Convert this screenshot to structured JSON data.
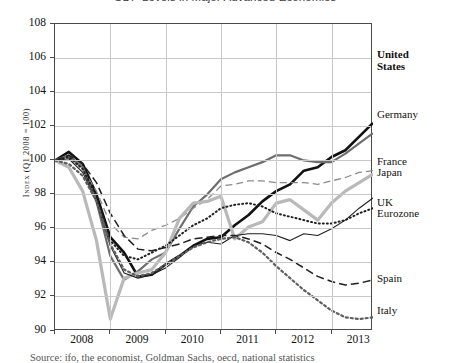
{
  "chart_data": {
    "type": "line",
    "title": "GDP Levels in Major Advanced Economies",
    "caption": "Source: ifo, the economist, Goldman Sachs, oecd, national statistics",
    "xlabel": "",
    "ylabel": "Index (Q1 2008 = 100)",
    "ylim": [
      90,
      108
    ],
    "xlim": [
      2008.0,
      2013.75
    ],
    "ytick_labels": [
      "108",
      "106",
      "104",
      "102",
      "100",
      "98",
      "96",
      "94",
      "92",
      "90"
    ],
    "ytick_values": [
      108,
      106,
      104,
      102,
      100,
      98,
      96,
      94,
      92,
      90
    ],
    "xtick_labels": [
      "2008",
      "2009",
      "2010",
      "2011",
      "2012",
      "2013"
    ],
    "xtick_values": [
      2008,
      2009,
      2010,
      2011,
      2012,
      2013
    ],
    "grid": true,
    "legend_position": "right-inline-end-labels",
    "x": [
      2008.0,
      2008.25,
      2008.5,
      2008.75,
      2009.0,
      2009.25,
      2009.5,
      2009.75,
      2010.0,
      2010.25,
      2010.5,
      2010.75,
      2011.0,
      2011.25,
      2011.5,
      2011.75,
      2012.0,
      2012.25,
      2012.5,
      2012.75,
      2013.0,
      2013.25,
      2013.5,
      2013.75
    ],
    "series": [
      {
        "name": "United States",
        "color": "#111111",
        "width": 2.6,
        "dash": "none",
        "label_bold": true,
        "values": [
          100.0,
          100.5,
          99.8,
          98.0,
          95.5,
          94.6,
          93.2,
          93.3,
          93.9,
          94.4,
          95.0,
          95.4,
          95.5,
          96.2,
          96.8,
          97.6,
          98.2,
          98.6,
          99.4,
          99.6,
          100.2,
          100.6,
          101.4,
          102.2
        ]
      },
      {
        "name": "Germany",
        "color": "#6e6e6e",
        "width": 2.2,
        "dash": "none",
        "label_bold": false,
        "values": [
          100.0,
          100.3,
          99.6,
          97.6,
          94.4,
          93.0,
          93.5,
          94.2,
          94.6,
          96.0,
          97.3,
          98.0,
          98.9,
          99.3,
          99.6,
          99.9,
          100.3,
          100.3,
          100.0,
          99.9,
          99.9,
          100.4,
          101.0,
          101.6
        ]
      },
      {
        "name": "France",
        "color": "#8a8a8a",
        "width": 1.3,
        "dash": "7 4",
        "label_bold": false,
        "values": [
          100.0,
          100.2,
          99.5,
          98.2,
          96.3,
          95.5,
          95.4,
          95.9,
          96.2,
          96.6,
          97.2,
          97.7,
          98.5,
          98.6,
          98.8,
          98.8,
          98.7,
          98.7,
          98.7,
          98.6,
          98.8,
          99.0,
          99.3,
          99.4
        ]
      },
      {
        "name": "Japan",
        "color": "#b9b9b9",
        "width": 3.2,
        "dash": "none",
        "label_bold": false,
        "values": [
          100.0,
          99.6,
          98.2,
          95.3,
          90.7,
          93.1,
          93.4,
          93.6,
          94.6,
          96.6,
          97.5,
          97.6,
          97.9,
          95.4,
          96.1,
          96.4,
          97.5,
          97.7,
          97.1,
          96.5,
          97.5,
          98.2,
          98.7,
          99.2
        ]
      },
      {
        "name": "UK",
        "color": "#1f1f1f",
        "width": 1.1,
        "dash": "none",
        "label_bold": false,
        "values": [
          100.0,
          100.1,
          99.3,
          97.6,
          95.0,
          93.4,
          93.1,
          93.3,
          93.7,
          94.3,
          95.0,
          95.2,
          95.1,
          95.6,
          95.7,
          95.7,
          95.6,
          95.3,
          95.7,
          95.6,
          96.0,
          96.5,
          97.2,
          97.8
        ]
      },
      {
        "name": "Eurozone",
        "color": "#1f1f1f",
        "width": 2.0,
        "dash": "1 3",
        "label_bold": false,
        "values": [
          100.0,
          100.2,
          99.5,
          97.9,
          95.3,
          94.4,
          94.2,
          94.6,
          95.0,
          95.6,
          96.2,
          96.6,
          97.2,
          97.4,
          97.5,
          97.3,
          96.9,
          96.7,
          96.5,
          96.3,
          96.3,
          96.5,
          96.9,
          97.2
        ]
      },
      {
        "name": "Spain",
        "color": "#1f1f1f",
        "width": 1.5,
        "dash": "8 4",
        "label_bold": false,
        "values": [
          100.0,
          100.3,
          99.8,
          98.7,
          96.9,
          95.6,
          94.8,
          94.7,
          94.9,
          95.1,
          95.4,
          95.5,
          95.6,
          95.6,
          95.4,
          95.1,
          94.6,
          94.2,
          93.7,
          93.2,
          92.9,
          92.7,
          92.8,
          93.0
        ]
      },
      {
        "name": "Italy",
        "color": "#5e5e5e",
        "width": 2.2,
        "dash": "2 3",
        "label_bold": false,
        "values": [
          100.0,
          99.8,
          99.1,
          97.6,
          95.1,
          93.6,
          93.2,
          93.4,
          93.9,
          94.4,
          94.9,
          95.2,
          95.4,
          95.5,
          95.2,
          94.6,
          93.8,
          93.1,
          92.4,
          91.8,
          91.2,
          90.8,
          90.7,
          90.8
        ]
      }
    ],
    "end_labels": [
      {
        "name": "United States",
        "line1": "United",
        "line2": "States",
        "top": 48,
        "bold": true
      },
      {
        "name": "Germany",
        "line1": "Germany",
        "line2": "",
        "top": 108,
        "bold": false
      },
      {
        "name": "France",
        "line1": "France",
        "line2": "",
        "top": 155,
        "bold": false
      },
      {
        "name": "Japan",
        "line1": "Japan",
        "line2": "",
        "top": 166,
        "bold": false
      },
      {
        "name": "UK",
        "line1": "UK",
        "line2": "",
        "top": 196,
        "bold": false
      },
      {
        "name": "Eurozone",
        "line1": "Eurozone",
        "line2": "",
        "top": 207,
        "bold": false
      },
      {
        "name": "Spain",
        "line1": "Spain",
        "line2": "",
        "top": 272,
        "bold": false
      },
      {
        "name": "Italy",
        "line1": "Italy",
        "line2": "",
        "top": 304,
        "bold": false
      }
    ]
  }
}
